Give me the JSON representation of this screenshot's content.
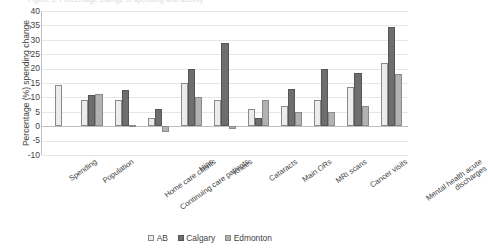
{
  "top_clipped_text": "Figure 3: Percentage change in spending and activity",
  "legend": {
    "position": "bottom-center",
    "items": [
      {
        "label": "AB",
        "color": "#ececec",
        "icon": "legend-swatch-icon"
      },
      {
        "label": "Calgary",
        "color": "#6e6e6e",
        "icon": "legend-swatch-icon"
      },
      {
        "label": "Edmonton",
        "color": "#b2b2b2",
        "icon": "legend-swatch-icon"
      }
    ]
  },
  "chart_data": {
    "type": "bar",
    "title": "",
    "xlabel": "",
    "ylabel": "Percentage (%) spending change",
    "ylim": [
      -10,
      40
    ],
    "ytick_step": 5,
    "yticks": [
      "40",
      "35",
      "30",
      "25",
      "20",
      "15",
      "10",
      "5",
      "0",
      "-5",
      "-10"
    ],
    "grid": true,
    "categories": [
      "Spending",
      "Population",
      "Home care clients",
      "Continuing care patients",
      "Hips",
      "Knees",
      "Cataracts",
      "Main ORs",
      "MRI scans",
      "Cancer visits",
      "Mental health acute discharges"
    ],
    "series": [
      {
        "name": "AB",
        "color": "#ececec",
        "values": [
          14.2,
          9.0,
          9.0,
          3.0,
          15.0,
          9.0,
          6.0,
          7.0,
          9.0,
          13.5,
          22.0
        ]
      },
      {
        "name": "Calgary",
        "color": "#6e6e6e",
        "values": [
          null,
          10.7,
          12.5,
          6.0,
          20.0,
          29.0,
          3.0,
          13.0,
          20.0,
          18.5,
          34.5
        ]
      },
      {
        "name": "Edmonton",
        "color": "#b2b2b2",
        "values": [
          null,
          11.3,
          0.5,
          -2.0,
          10.0,
          -1.0,
          9.0,
          5.0,
          5.0,
          7.0,
          18.0
        ]
      }
    ]
  }
}
